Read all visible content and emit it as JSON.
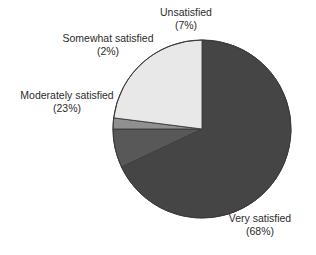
{
  "chart_data": {
    "type": "pie",
    "title": "",
    "labels": [
      "Very satisfied",
      "Unsatisfied",
      "Somewhat satisfied",
      "Moderately satisfied"
    ],
    "values": [
      68,
      7,
      2,
      23
    ],
    "value_suffix": "%",
    "legend": "none",
    "slices": [
      {
        "name": "Very satisfied",
        "label": "Very satisfied",
        "percent_text": "(68%)",
        "value": 68,
        "color": "#454545"
      },
      {
        "name": "Unsatisfied",
        "label": "Unsatisfied",
        "percent_text": "(7%)",
        "value": 7,
        "color": "#585858"
      },
      {
        "name": "Somewhat satisfied",
        "label": "Somewhat satisfied",
        "percent_text": "(2%)",
        "value": 2,
        "color": "#909090"
      },
      {
        "name": "Moderately satisfied",
        "label": "Moderately satisfied",
        "percent_text": "(23%)",
        "value": 23,
        "color": "#e8e8e8"
      }
    ],
    "start_angle_oclock": 12,
    "direction": "clockwise",
    "background": "#ffffff",
    "text_color": "#2b2b2b",
    "outline_color": "#3a3a3a"
  }
}
